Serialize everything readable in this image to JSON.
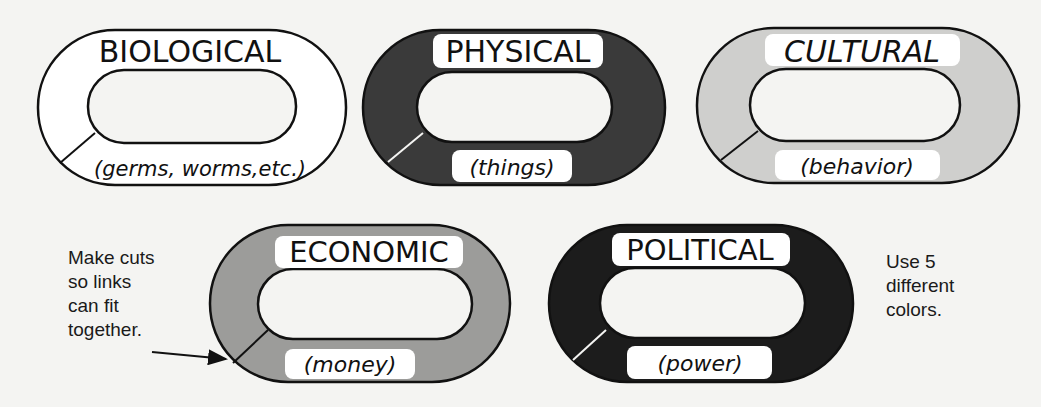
{
  "links": [
    {
      "id": "biological",
      "title": "BIOLOGICAL",
      "subtitle": "(germs, worms,etc.)",
      "fill": "#ffffff",
      "label_bg": "#ffffff"
    },
    {
      "id": "physical",
      "title": "PHYSICAL",
      "subtitle": "(things)",
      "fill": "#3a3a3a",
      "label_bg": "#ffffff"
    },
    {
      "id": "cultural",
      "title": "CULTURAL",
      "subtitle": "(behavior)",
      "fill": "#cfcfcd",
      "label_bg": "#ffffff"
    },
    {
      "id": "economic",
      "title": "ECONOMIC",
      "subtitle": "(money)",
      "fill": "#9c9c9a",
      "label_bg": "#ffffff"
    },
    {
      "id": "political",
      "title": "POLITICAL",
      "subtitle": "(power)",
      "fill": "#1c1c1c",
      "label_bg": "#ffffff"
    }
  ],
  "notes": {
    "cuts": "Make cuts\nso links\ncan fit\ntogether.",
    "colors": "Use 5\ndifferent\ncolors."
  }
}
